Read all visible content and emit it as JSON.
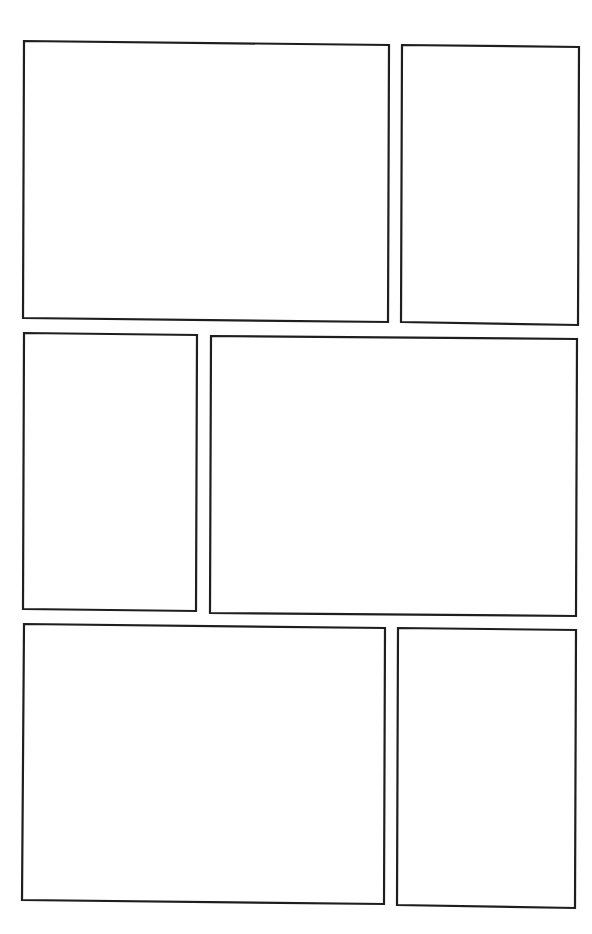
{
  "page": {
    "width": 592,
    "height": 934,
    "background": "#ffffff",
    "border_color": "#1e1e1e",
    "layout": "comic-page-template",
    "rows": 3,
    "panel_count": 6
  },
  "panels": [
    {
      "id": "panel-1",
      "row": 1,
      "points": "24,41 389,45 388,322 23,318"
    },
    {
      "id": "panel-2",
      "row": 1,
      "points": "402,45 579,47 578,325 401,322"
    },
    {
      "id": "panel-3",
      "row": 2,
      "points": "24,333 197,335 196,611 23,609"
    },
    {
      "id": "panel-4",
      "row": 2,
      "points": "211,336 577,339 576,616 210,613"
    },
    {
      "id": "panel-5",
      "row": 3,
      "points": "24,624 385,628 384,904 22,900"
    },
    {
      "id": "panel-6",
      "row": 3,
      "points": "398,628 576,630 575,908 397,905"
    }
  ]
}
